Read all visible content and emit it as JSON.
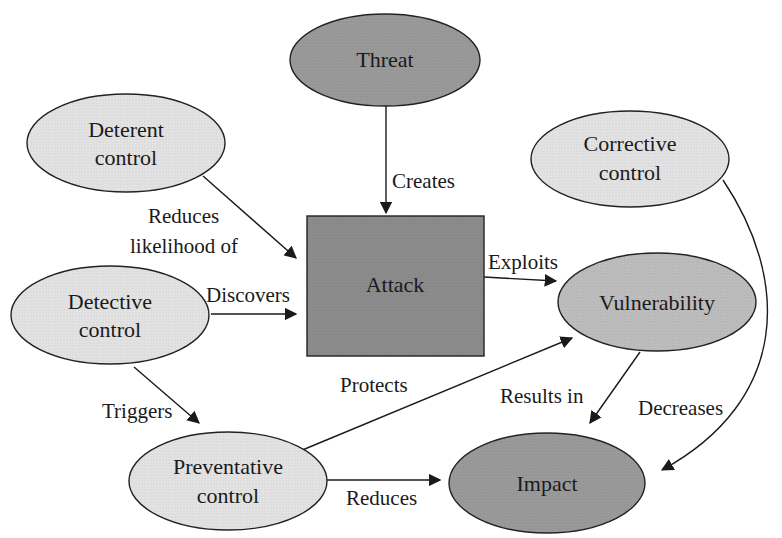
{
  "diagram": {
    "colors": {
      "light_node": "#e3e3e3",
      "medium_node": "#bdbdbd",
      "dark_node": "#9a9a9a",
      "attack_box": "#8c8c8c",
      "stroke": "#222222"
    },
    "nodes": {
      "threat": {
        "label": "Threat",
        "shade": "dark"
      },
      "deterent": {
        "line1": "Deterent",
        "line2": "control",
        "shade": "light"
      },
      "corrective": {
        "line1": "Corrective",
        "line2": "control",
        "shade": "light"
      },
      "attack": {
        "label": "Attack",
        "shape": "rectangle",
        "shade": "dark"
      },
      "detective": {
        "line1": "Detective",
        "line2": "control",
        "shade": "light"
      },
      "vulnerability": {
        "label": "Vulnerability",
        "shade": "medium"
      },
      "preventative": {
        "line1": "Preventative",
        "line2": "control",
        "shade": "light"
      },
      "impact": {
        "label": "Impact",
        "shade": "dark"
      }
    },
    "edges": {
      "creates": {
        "from": "Threat",
        "to": "Attack",
        "label": "Creates"
      },
      "reduces_likelihood": {
        "from": "Deterent control",
        "to": "Attack",
        "line1": "Reduces",
        "line2": "likelihood of"
      },
      "discovers": {
        "from": "Detective control",
        "to": "Attack",
        "label": "Discovers"
      },
      "exploits": {
        "from": "Attack",
        "to": "Vulnerability",
        "label": "Exploits"
      },
      "triggers": {
        "from": "Detective control",
        "to": "Preventative control",
        "label": "Triggers"
      },
      "protects": {
        "from": "Preventative control",
        "to": "Vulnerability",
        "label": "Protects"
      },
      "results_in": {
        "from": "Vulnerability",
        "to": "Impact",
        "label": "Results in"
      },
      "decreases": {
        "from": "Corrective control",
        "to": "Impact",
        "label": "Decreases"
      },
      "reduces": {
        "from": "Preventative control",
        "to": "Impact",
        "label": "Reduces"
      }
    }
  }
}
